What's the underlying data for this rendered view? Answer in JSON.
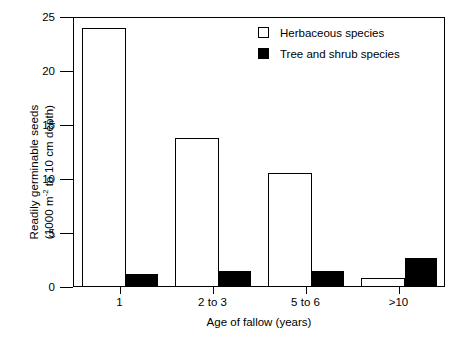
{
  "chart_data": {
    "type": "bar",
    "title": "",
    "xlabel": "Age of fallow (years)",
    "ylabel_line1": "Readily germinable seeds",
    "ylabel_line2_prefix": "(1000 m",
    "ylabel_line2_sup": "-2",
    "ylabel_line2_suffix": " to 10 cm depth)",
    "categories": [
      "1",
      "2 to 3",
      "5 to 6",
      ">10"
    ],
    "series": [
      {
        "name": "Herbaceous species",
        "style": "open",
        "values": [
          24.0,
          13.8,
          10.6,
          0.8
        ]
      },
      {
        "name": "Tree and shrub species",
        "style": "filled",
        "values": [
          1.2,
          1.5,
          1.5,
          2.7
        ]
      }
    ],
    "ylim": [
      0,
      25
    ],
    "yticks": [
      0,
      5,
      10,
      15,
      20,
      25
    ],
    "ytick_labels": [
      "0",
      "5",
      "10",
      "15",
      "20",
      "25"
    ],
    "grid": false,
    "legend_position": "top-right",
    "colors": {
      "axis": "#000000",
      "herbaceous_fill": "#ffffff",
      "tree_shrub_fill": "#000000"
    }
  },
  "legend": {
    "items": [
      {
        "label": "Herbaceous species",
        "style": "open"
      },
      {
        "label": "Tree and shrub species",
        "style": "filled"
      }
    ]
  }
}
